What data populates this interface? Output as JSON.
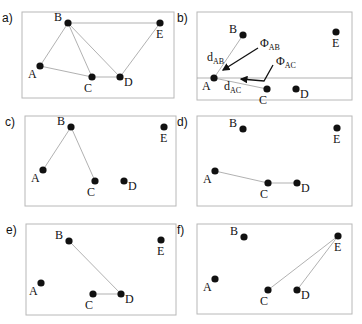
{
  "figure": {
    "panels": [
      {
        "id": "a",
        "label": "a)",
        "frame": {
          "x": 22,
          "y": 12,
          "w": 152,
          "h": 86
        },
        "nodes": {
          "A": [
            40,
            66
          ],
          "B": [
            68,
            23
          ],
          "C": [
            92,
            77
          ],
          "D": [
            120,
            77
          ],
          "E": [
            160,
            23
          ]
        },
        "edges": [
          [
            "A",
            "B"
          ],
          [
            "A",
            "C"
          ],
          [
            "B",
            "C"
          ],
          [
            "B",
            "D"
          ],
          [
            "B",
            "E"
          ],
          [
            "C",
            "D"
          ],
          [
            "D",
            "E"
          ]
        ]
      },
      {
        "id": "b",
        "label": "b)",
        "frame": {
          "x": 197,
          "y": 12,
          "w": 155,
          "h": 88
        },
        "nodes": {
          "A": [
            214,
            78
          ],
          "B": [
            243,
            35
          ],
          "C": [
            267,
            89
          ],
          "D": [
            296,
            89
          ],
          "E": [
            336,
            32
          ]
        },
        "edges": [
          [
            "A",
            "B"
          ],
          [
            "A",
            "C"
          ]
        ],
        "annotations": {
          "d_AB": {
            "main": "d",
            "sub": "AB"
          },
          "d_AC": {
            "main": "d",
            "sub": "AC"
          },
          "phi_AB": {
            "main": "Φ",
            "sub": "AB"
          },
          "phi_AC": {
            "main": "Φ",
            "sub": "AC"
          }
        },
        "reference_line_y": 78
      },
      {
        "id": "c",
        "label": "c)",
        "frame": {
          "x": 25,
          "y": 116,
          "w": 151,
          "h": 90
        },
        "nodes": {
          "A": [
            43,
            170
          ],
          "B": [
            71,
            127
          ],
          "C": [
            95,
            181
          ],
          "D": [
            124,
            181
          ],
          "E": [
            164,
            127
          ]
        },
        "edges": [
          [
            "A",
            "B"
          ],
          [
            "B",
            "C"
          ]
        ]
      },
      {
        "id": "d",
        "label": "d)",
        "frame": {
          "x": 197,
          "y": 116,
          "w": 155,
          "h": 90
        },
        "nodes": {
          "A": [
            215,
            171
          ],
          "B": [
            243,
            129
          ],
          "C": [
            268,
            183
          ],
          "D": [
            297,
            183
          ],
          "E": [
            337,
            128
          ]
        },
        "edges": [
          [
            "A",
            "C"
          ],
          [
            "C",
            "D"
          ]
        ]
      },
      {
        "id": "e",
        "label": "e)",
        "frame": {
          "x": 26,
          "y": 224,
          "w": 150,
          "h": 91
        },
        "nodes": {
          "A": [
            41,
            283
          ],
          "B": [
            69,
            241
          ],
          "C": [
            93,
            294
          ],
          "D": [
            121,
            294
          ],
          "E": [
            161,
            240
          ]
        },
        "edges": [
          [
            "B",
            "D"
          ],
          [
            "C",
            "D"
          ]
        ]
      },
      {
        "id": "f",
        "label": "f)",
        "frame": {
          "x": 197,
          "y": 224,
          "w": 155,
          "h": 90
        },
        "nodes": {
          "A": [
            215,
            279
          ],
          "B": [
            244,
            237
          ],
          "C": [
            268,
            290
          ],
          "D": [
            297,
            290
          ],
          "E": [
            338,
            236
          ]
        },
        "edges": [
          [
            "E",
            "C"
          ],
          [
            "E",
            "D"
          ]
        ]
      }
    ],
    "node_names": [
      "A",
      "B",
      "C",
      "D",
      "E"
    ]
  }
}
